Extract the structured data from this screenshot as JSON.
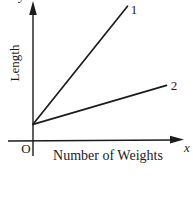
{
  "figure": {
    "y_axis_letter": "y",
    "x_axis_letter": "x",
    "origin_label": "O",
    "y_axis_title": "Length",
    "x_axis_title": "Number of Weights",
    "line1_label": "1",
    "line2_label": "2"
  },
  "colors": {
    "ink": "#1c1c1c",
    "background": "#ffffff"
  },
  "chart_data": {
    "type": "line",
    "title": "",
    "xlabel": "Number of Weights",
    "ylabel": "Length",
    "x_axis_symbol": "x",
    "y_axis_symbol": "y",
    "origin_label": "O",
    "axes": "qualitative sketch, no tick marks or numeric scale",
    "legend_position": "labels at line ends",
    "series": [
      {
        "name": "1",
        "points_frac": [
          [
            0,
            0.12
          ],
          [
            0.63,
            0.97
          ]
        ]
      },
      {
        "name": "2",
        "points_frac": [
          [
            0,
            0.12
          ],
          [
            0.89,
            0.4
          ]
        ]
      }
    ]
  }
}
